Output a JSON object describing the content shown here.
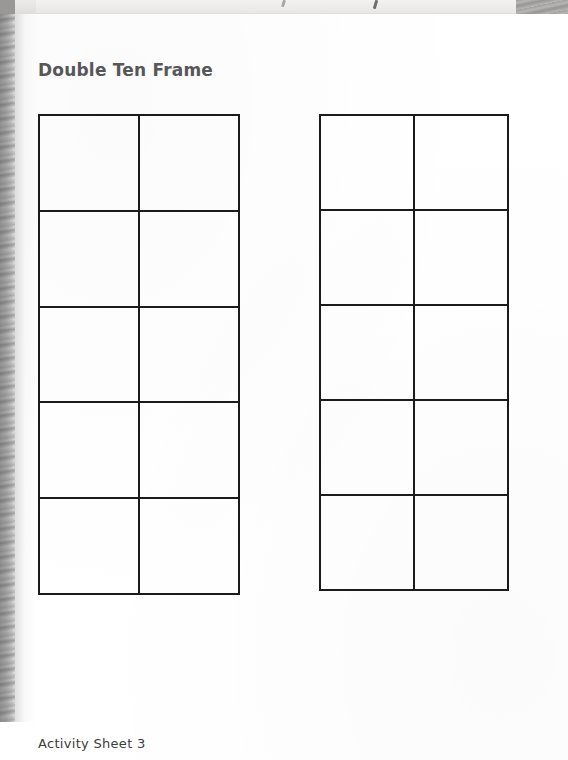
{
  "document": {
    "type": "worksheet",
    "title": "Double Ten Frame",
    "footer": "Activity Sheet 3",
    "page_background": "#ffffff",
    "title_color": "#58585a",
    "footer_color": "#3c3c3c",
    "rule_color": "#1b1b1b"
  },
  "frames": [
    {
      "name": "left-ten-frame",
      "columns": 2,
      "rows": 5,
      "total_cells": 10,
      "filled_cells": 0,
      "cells": [
        {
          "row": 1,
          "col": 1,
          "value": ""
        },
        {
          "row": 1,
          "col": 2,
          "value": ""
        },
        {
          "row": 2,
          "col": 1,
          "value": ""
        },
        {
          "row": 2,
          "col": 2,
          "value": ""
        },
        {
          "row": 3,
          "col": 1,
          "value": ""
        },
        {
          "row": 3,
          "col": 2,
          "value": ""
        },
        {
          "row": 4,
          "col": 1,
          "value": ""
        },
        {
          "row": 4,
          "col": 2,
          "value": ""
        },
        {
          "row": 5,
          "col": 1,
          "value": ""
        },
        {
          "row": 5,
          "col": 2,
          "value": ""
        }
      ]
    },
    {
      "name": "right-ten-frame",
      "columns": 2,
      "rows": 5,
      "total_cells": 10,
      "filled_cells": 0,
      "cells": [
        {
          "row": 1,
          "col": 1,
          "value": ""
        },
        {
          "row": 1,
          "col": 2,
          "value": ""
        },
        {
          "row": 2,
          "col": 1,
          "value": ""
        },
        {
          "row": 2,
          "col": 2,
          "value": ""
        },
        {
          "row": 3,
          "col": 1,
          "value": ""
        },
        {
          "row": 3,
          "col": 2,
          "value": ""
        },
        {
          "row": 4,
          "col": 1,
          "value": ""
        },
        {
          "row": 4,
          "col": 2,
          "value": ""
        },
        {
          "row": 5,
          "col": 1,
          "value": ""
        },
        {
          "row": 5,
          "col": 2,
          "value": ""
        }
      ]
    }
  ],
  "scan_artifacts": {
    "top_band": "cut-off-text-strip",
    "left_gutter": "book-spine-shadow",
    "right_corner": "page-edge-shadow"
  }
}
